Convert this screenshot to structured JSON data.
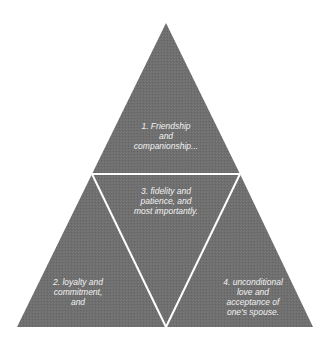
{
  "diagram": {
    "type": "triangle-pyramid",
    "colors": {
      "background": "#ffffff",
      "fill": "#6f6f6f",
      "divider": "#ffffff",
      "text": "#f2f2f2"
    },
    "sections": [
      {
        "id": "top",
        "position": "top",
        "text": "1. Friendship\nand\ncompanionship..."
      },
      {
        "id": "left",
        "position": "bottom-left",
        "text": "2. loyalty and\ncommitment,\nand"
      },
      {
        "id": "center",
        "position": "center-inverted",
        "text": "3. fidelity and\npatience, and\nmost importantly."
      },
      {
        "id": "right",
        "position": "bottom-right",
        "text": "4. unconditional\nlove and\nacceptance of\none's spouse."
      }
    ]
  }
}
